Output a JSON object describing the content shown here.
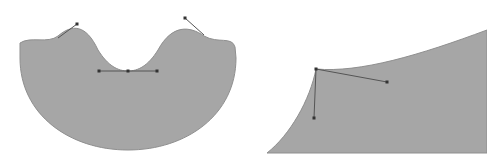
{
  "diagram": {
    "colors": {
      "fill": "#a6a6a6",
      "outline": "#8f8f8f",
      "handle": "#555555",
      "handle_light": "#8a8a8a",
      "anchor": "#333333",
      "background": "#ffffff"
    },
    "shapes": [
      {
        "name": "left-bowl-shape",
        "path": "M 20 43 C 30 36, 48 44, 58 36 C 72 24, 86 24, 98 50 C 108 66, 118 71, 128 71 C 138 71, 148 66, 158 50 C 172 24, 190 26, 204 36 C 218 44, 232 36, 235 47 L 236 58 C 236 115, 186 150, 128 150 C 70 150, 20 115, 20 58 Z",
        "handles": [
          {
            "from": [
              58,
              38
            ],
            "to": [
              77,
              24
            ]
          },
          {
            "from": [
              204,
              35
            ],
            "to": [
              185,
              18
            ]
          },
          {
            "from": [
              99,
              71
            ],
            "to": [
              157,
              71
            ]
          }
        ],
        "anchors": [
          [
            77,
            24
          ],
          [
            185,
            18
          ],
          [
            99,
            71
          ],
          [
            128,
            71
          ],
          [
            157,
            71
          ]
        ]
      },
      {
        "name": "right-wedge-shape",
        "path": "M 267 153 C 290 135, 310 100, 316 69 C 360 73, 420 55, 487 30 L 487 153 Z",
        "handles": [
          {
            "from": [
              316,
              69
            ],
            "to": [
              387,
              82
            ]
          },
          {
            "from": [
              316,
              69
            ],
            "to": [
              314,
              118
            ]
          }
        ],
        "anchors": [
          [
            316,
            69
          ],
          [
            387,
            82
          ],
          [
            314,
            118
          ]
        ]
      }
    ]
  }
}
